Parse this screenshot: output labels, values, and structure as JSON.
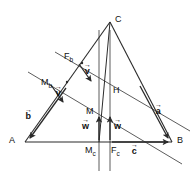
{
  "figure": {
    "type": "geometry-diagram",
    "stroke_color": "#2b2b2b",
    "background_color": "#ffffff",
    "label_color": "#111111"
  },
  "points": [
    {
      "id": "A",
      "label": "A",
      "base": "A",
      "sub": "",
      "x": 25,
      "y": 142,
      "label_x": 9,
      "label_y": 137
    },
    {
      "id": "B",
      "label": "B",
      "base": "B",
      "sub": "",
      "x": 172,
      "y": 142,
      "label_x": 177,
      "label_y": 137
    },
    {
      "id": "C",
      "label": "C",
      "base": "C",
      "sub": "",
      "x": 110,
      "y": 22,
      "label_x": 115,
      "label_y": 16
    },
    {
      "id": "H",
      "label": "H",
      "base": "H",
      "sub": "",
      "x": 110,
      "y": 93,
      "label_x": 113,
      "label_y": 87
    },
    {
      "id": "M",
      "label": "M",
      "base": "M",
      "sub": "",
      "x": 99,
      "y": 115,
      "label_x": 86,
      "label_y": 108
    },
    {
      "id": "Mb",
      "label": "Mb",
      "base": "M",
      "sub": "b",
      "x": 67,
      "y": 82,
      "label_x": 41,
      "label_y": 79
    },
    {
      "id": "Mc",
      "label": "Mc",
      "base": "M",
      "sub": "c",
      "x": 99,
      "y": 142,
      "label_x": 86,
      "label_y": 147
    },
    {
      "id": "Fb",
      "label": "Fb",
      "base": "F",
      "sub": "b",
      "x": 82,
      "y": 63,
      "label_x": 65,
      "label_y": 53
    },
    {
      "id": "Fc",
      "label": "Fc",
      "base": "F",
      "sub": "c",
      "x": 110,
      "y": 142,
      "label_x": 111,
      "label_y": 147
    }
  ],
  "vectors": [
    {
      "id": "b",
      "label": "b",
      "label_x": 25,
      "label_y": 112,
      "from_x": 64,
      "from_y": 90,
      "to_x": 29,
      "to_y": 139
    },
    {
      "id": "a",
      "label": "a",
      "label_x": 155,
      "label_y": 107,
      "from_x": 140,
      "from_y": 87,
      "to_x": 169,
      "to_y": 139
    },
    {
      "id": "c",
      "label": "c",
      "label_x": 132,
      "label_y": 147,
      "from_x": 115,
      "from_y": 142,
      "to_x": 169,
      "to_y": 142
    },
    {
      "id": "v1",
      "label": "v",
      "label_x": 84,
      "label_y": 67,
      "from_x": 80,
      "from_y": 66,
      "to_x": 91,
      "to_y": 82
    },
    {
      "id": "v2",
      "label": "v",
      "label_x": 56,
      "label_y": 88,
      "from_x": 52,
      "from_y": 87,
      "to_x": 63,
      "to_y": 103
    },
    {
      "id": "w1",
      "label": "w",
      "label_x": 82,
      "label_y": 122,
      "from_x": 99,
      "from_y": 140,
      "to_x": 99,
      "to_y": 118
    },
    {
      "id": "w2",
      "label": "w",
      "label_x": 114,
      "label_y": 122,
      "from_x": 110,
      "from_y": 140,
      "to_x": 110,
      "to_y": 118
    }
  ],
  "lines": {
    "triangle": {
      "name": "triangle-ABC",
      "path": "M 25 142 L 172 142 L 110 22 Z"
    },
    "vertical_left": {
      "name": "vertical-through-Mc",
      "x": 99,
      "y1": 30,
      "y2": 171
    },
    "vertical_right": {
      "name": "vertical-through-C-Fc",
      "x": 110,
      "y1": 30,
      "y2": 171
    },
    "diagonal_upper": {
      "name": "diagonal-Fb-to-B",
      "x1": 55,
      "y1": 52,
      "x2": 188,
      "y2": 130
    },
    "diagonal_lower": {
      "name": "diagonal-Mb-through-M",
      "x1": 30,
      "y1": 73,
      "x2": 180,
      "y2": 163
    },
    "median_cmc": {
      "name": "median-C-to-Mc",
      "x1": 110,
      "y1": 22,
      "x2": 99,
      "y2": 142
    },
    "segment_extra": {
      "name": "segment-A-to-C-extended",
      "x1": 25,
      "y1": 142,
      "x2": 110,
      "y2": 22
    }
  }
}
